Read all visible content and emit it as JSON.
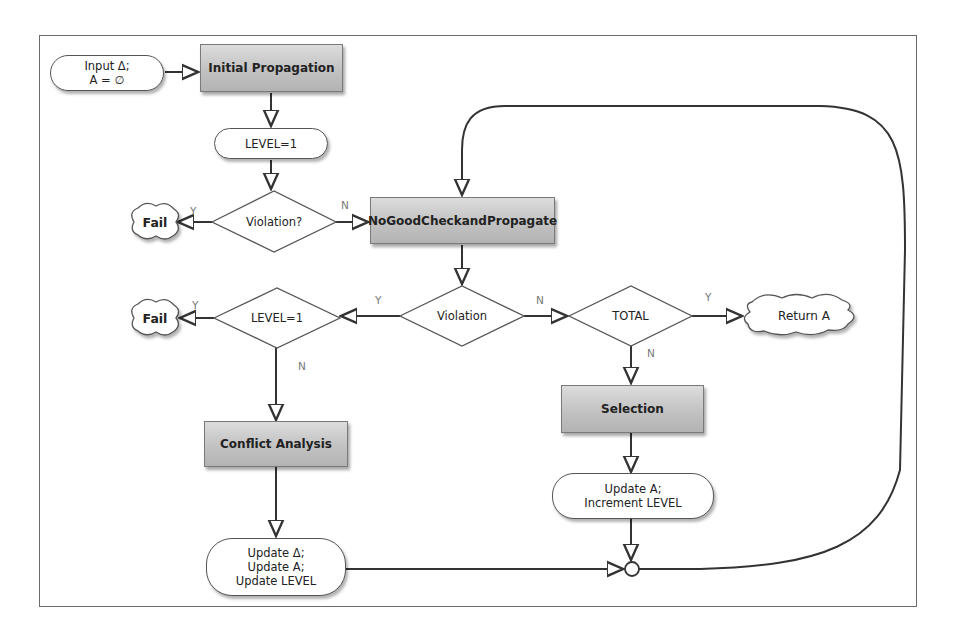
{
  "diagram": {
    "nodes": {
      "input": {
        "line1": "Input Δ;",
        "line2": "A = ∅"
      },
      "initial_propagation": "Initial Propagation",
      "level_init": "LEVEL=1",
      "violation_check_1": "Violation?",
      "fail_1": "Fail",
      "nogood": "NoGoodCheckandPropagate",
      "violation_check_2": "Violation",
      "level_check": "LEVEL=1",
      "fail_2": "Fail",
      "total_check": "TOTAL",
      "return": "Return A",
      "conflict_analysis": "Conflict Analysis",
      "update_backtrack": {
        "line1": "Update Δ;",
        "line2": "Update A;",
        "line3": "Update LEVEL"
      },
      "selection": "Selection",
      "update_forward": {
        "line1": "Update A;",
        "line2": "Increment LEVEL"
      }
    },
    "edge_labels": {
      "violation1_yes": "Y",
      "violation1_no": "N",
      "violation2_yes": "Y",
      "violation2_no": "N",
      "level_yes": "Y",
      "level_no": "N",
      "total_yes": "Y",
      "total_no": "N"
    },
    "colors": {
      "process_fill": "#c4c4c4",
      "stroke": "#333333",
      "label": "#777777"
    }
  }
}
